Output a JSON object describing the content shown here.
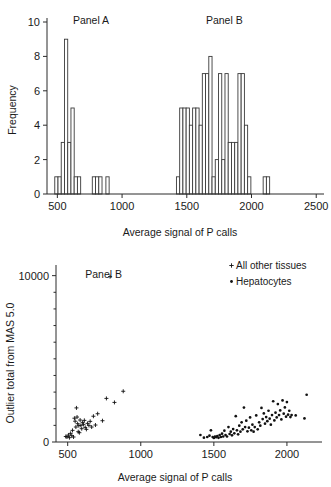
{
  "figure": {
    "background": "#ffffff",
    "ink_color": "#1a1a1a"
  },
  "chart_data": [
    {
      "id": "histogram",
      "type": "bar",
      "title": "",
      "xlabel": "Average signal of P calls",
      "ylabel": "Frequency",
      "xlim": [
        420,
        2560
      ],
      "ylim": [
        0,
        10
      ],
      "xticks": [
        500,
        1000,
        1500,
        2000,
        2500
      ],
      "yticks": [
        0,
        2,
        4,
        6,
        8,
        10
      ],
      "grid": false,
      "bin_width": 25,
      "annotations": [
        {
          "text": "Panel A",
          "x": 760,
          "y": 9.9
        },
        {
          "text": "Panel B",
          "x": 1790,
          "y": 9.9
        }
      ],
      "bins": [
        {
          "x": 480,
          "count": 1
        },
        {
          "x": 505,
          "count": 1
        },
        {
          "x": 530,
          "count": 3
        },
        {
          "x": 555,
          "count": 9
        },
        {
          "x": 580,
          "count": 3
        },
        {
          "x": 605,
          "count": 5
        },
        {
          "x": 630,
          "count": 1
        },
        {
          "x": 655,
          "count": 1
        },
        {
          "x": 770,
          "count": 1
        },
        {
          "x": 795,
          "count": 1
        },
        {
          "x": 820,
          "count": 1
        },
        {
          "x": 875,
          "count": 1
        },
        {
          "x": 1420,
          "count": 1
        },
        {
          "x": 1445,
          "count": 5
        },
        {
          "x": 1470,
          "count": 5
        },
        {
          "x": 1495,
          "count": 5
        },
        {
          "x": 1520,
          "count": 4
        },
        {
          "x": 1545,
          "count": 5
        },
        {
          "x": 1570,
          "count": 5
        },
        {
          "x": 1595,
          "count": 4
        },
        {
          "x": 1620,
          "count": 7
        },
        {
          "x": 1645,
          "count": 7
        },
        {
          "x": 1670,
          "count": 8
        },
        {
          "x": 1695,
          "count": 1
        },
        {
          "x": 1720,
          "count": 2
        },
        {
          "x": 1745,
          "count": 7
        },
        {
          "x": 1770,
          "count": 2
        },
        {
          "x": 1795,
          "count": 7
        },
        {
          "x": 1820,
          "count": 3
        },
        {
          "x": 1845,
          "count": 3
        },
        {
          "x": 1870,
          "count": 3
        },
        {
          "x": 1895,
          "count": 7
        },
        {
          "x": 1920,
          "count": 7
        },
        {
          "x": 1945,
          "count": 4
        },
        {
          "x": 1970,
          "count": 1
        },
        {
          "x": 2090,
          "count": 1
        },
        {
          "x": 2115,
          "count": 1
        }
      ]
    },
    {
      "id": "scatter",
      "type": "scatter",
      "title": "",
      "xlabel": "Average signal of P calls",
      "ylabel": "Outlier total from MAS 5.0",
      "xlim": [
        420,
        2240
      ],
      "ylim": [
        0,
        10400
      ],
      "xticks": [
        500,
        1000,
        1500,
        2000
      ],
      "yticks": [
        0,
        10000
      ],
      "minor_yticks": [
        1000,
        2000,
        3000,
        4000,
        5000,
        6000,
        7000,
        8000,
        9000
      ],
      "grid": false,
      "legend_position": "top-right",
      "annotations": [
        {
          "text": "Panel B",
          "x": 620,
          "y": 9850
        }
      ],
      "series": [
        {
          "name": "All other tissues",
          "marker": "+",
          "points": [
            [
              487,
              330
            ],
            [
              495,
              300
            ],
            [
              505,
              420
            ],
            [
              512,
              260
            ],
            [
              520,
              520
            ],
            [
              528,
              380
            ],
            [
              533,
              700
            ],
            [
              540,
              300
            ],
            [
              546,
              1430
            ],
            [
              551,
              1250
            ],
            [
              556,
              900
            ],
            [
              560,
              2050
            ],
            [
              564,
              1500
            ],
            [
              568,
              1100
            ],
            [
              572,
              620
            ],
            [
              576,
              980
            ],
            [
              580,
              560
            ],
            [
              585,
              1320
            ],
            [
              590,
              1000
            ],
            [
              596,
              800
            ],
            [
              602,
              1180
            ],
            [
              608,
              1060
            ],
            [
              614,
              1300
            ],
            [
              620,
              880
            ],
            [
              628,
              760
            ],
            [
              636,
              1120
            ],
            [
              645,
              1000
            ],
            [
              654,
              1240
            ],
            [
              664,
              900
            ],
            [
              676,
              1550
            ],
            [
              690,
              1020
            ],
            [
              705,
              1700
            ],
            [
              738,
              1280
            ],
            [
              765,
              2620
            ],
            [
              790,
              9940
            ],
            [
              820,
              2380
            ],
            [
              880,
              3050
            ]
          ]
        },
        {
          "name": "Hepatocytes",
          "marker": "•",
          "points": [
            [
              1408,
              420
            ],
            [
              1432,
              260
            ],
            [
              1455,
              300
            ],
            [
              1470,
              380
            ],
            [
              1480,
              700
            ],
            [
              1492,
              300
            ],
            [
              1500,
              240
            ],
            [
              1508,
              330
            ],
            [
              1516,
              290
            ],
            [
              1524,
              360
            ],
            [
              1532,
              250
            ],
            [
              1540,
              420
            ],
            [
              1548,
              300
            ],
            [
              1556,
              500
            ],
            [
              1564,
              330
            ],
            [
              1572,
              680
            ],
            [
              1580,
              420
            ],
            [
              1590,
              330
            ],
            [
              1600,
              900
            ],
            [
              1608,
              480
            ],
            [
              1616,
              620
            ],
            [
              1624,
              400
            ],
            [
              1632,
              780
            ],
            [
              1640,
              520
            ],
            [
              1650,
              1550
            ],
            [
              1658,
              700
            ],
            [
              1666,
              460
            ],
            [
              1674,
              980
            ],
            [
              1682,
              620
            ],
            [
              1690,
              1180
            ],
            [
              1698,
              760
            ],
            [
              1706,
              2070
            ],
            [
              1714,
              900
            ],
            [
              1722,
              1280
            ],
            [
              1730,
              640
            ],
            [
              1740,
              860
            ],
            [
              1748,
              1480
            ],
            [
              1756,
              700
            ],
            [
              1764,
              1040
            ],
            [
              1772,
              620
            ],
            [
              1780,
              900
            ],
            [
              1790,
              1600
            ],
            [
              1800,
              760
            ],
            [
              1810,
              1180
            ],
            [
              1818,
              980
            ],
            [
              1826,
              2050
            ],
            [
              1834,
              1380
            ],
            [
              1842,
              1720
            ],
            [
              1850,
              1100
            ],
            [
              1858,
              1500
            ],
            [
              1866,
              1250
            ],
            [
              1874,
              1880
            ],
            [
              1882,
              1400
            ],
            [
              1890,
              1040
            ],
            [
              1898,
              1620
            ],
            [
              1906,
              2450
            ],
            [
              1914,
              1300
            ],
            [
              1922,
              1760
            ],
            [
              1930,
              1480
            ],
            [
              1938,
              2280
            ],
            [
              1946,
              1620
            ],
            [
              1954,
              1900
            ],
            [
              1962,
              1360
            ],
            [
              1970,
              2500
            ],
            [
              1978,
              1700
            ],
            [
              1986,
              2080
            ],
            [
              1994,
              1520
            ],
            [
              2000,
              2400
            ],
            [
              2008,
              1640
            ],
            [
              2016,
              1880
            ],
            [
              2024,
              1500
            ],
            [
              2032,
              1620
            ],
            [
              2060,
              1600
            ],
            [
              2120,
              1420
            ],
            [
              2135,
              2840
            ]
          ]
        }
      ]
    }
  ]
}
